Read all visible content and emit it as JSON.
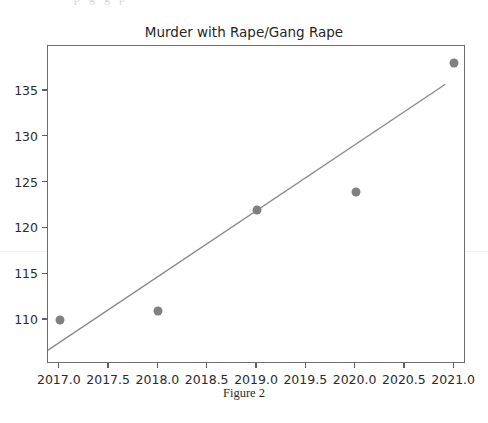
{
  "scan": {
    "top_fragment": "p g g p"
  },
  "figure": {
    "caption": "Figure 2"
  },
  "chart_data": {
    "type": "scatter",
    "title": "Murder with Rape/Gang Rape",
    "xlabel": "",
    "ylabel": "",
    "x": [
      2017,
      2018,
      2019,
      2020,
      2021
    ],
    "values": [
      110,
      111,
      122,
      124,
      138
    ],
    "series": [
      {
        "name": "Murder with Rape/Gang Rape",
        "values": [
          110,
          111,
          122,
          124,
          138
        ],
        "marker_color": "#808080"
      },
      {
        "name": "trend-line",
        "type": "line",
        "x": [
          2016.88,
          2020.93
        ],
        "values": [
          106.5,
          135.7
        ],
        "line_color": "#8a8a8a"
      }
    ],
    "xlim": [
      2016.88,
      2021.12
    ],
    "ylim": [
      105.2,
      139.9
    ],
    "xticks": [
      2017.0,
      2017.5,
      2018.0,
      2018.5,
      2019.0,
      2019.5,
      2020.0,
      2020.5,
      2021.0
    ],
    "xtick_labels": [
      "2017.0",
      "2017.5",
      "2018.0",
      "2018.5",
      "2019.0",
      "2019.5",
      "2020.0",
      "2020.5",
      "2021.0"
    ],
    "yticks": [
      110,
      115,
      120,
      125,
      130,
      135
    ],
    "ytick_labels": [
      "110",
      "115",
      "120",
      "125",
      "130",
      "135"
    ],
    "grid": false,
    "legend": "none",
    "frame_color": "#6e6e6e"
  }
}
